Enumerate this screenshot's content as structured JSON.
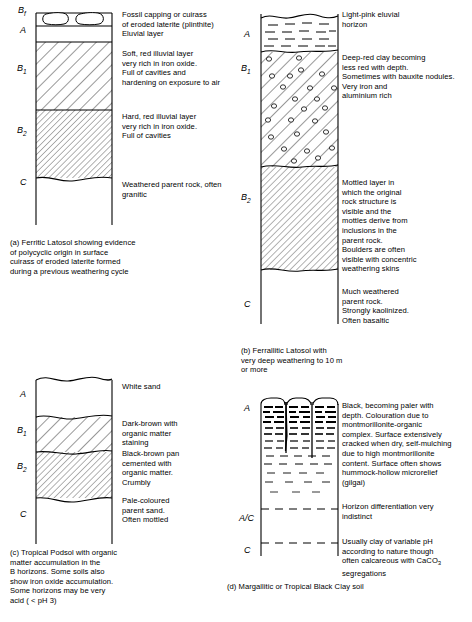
{
  "figure": {
    "panels": [
      {
        "id": "a",
        "caption": "(a) Ferritic Latosol showing evidence\nof polycyclic origin in surface\ncuirass of eroded laterite formed\nduring a previous weathering cycle",
        "horizons": [
          {
            "label": "B",
            "sub": "f",
            "fill": "plinthite-blobs"
          },
          {
            "label": "A",
            "sub": "",
            "fill": "blank"
          },
          {
            "label": "B",
            "sub": "1",
            "fill": "hatch-wide"
          },
          {
            "label": "B",
            "sub": "2",
            "fill": "hatch-fine"
          },
          {
            "label": "C",
            "sub": "",
            "fill": "blank"
          }
        ],
        "annotations": [
          "Fossil capping or cuirass\nof eroded laterite (plinthite)\nEluvial layer",
          "Soft, red illuvial layer\nvery rich in iron oxide.\nFull of cavities and\nhardening on exposure to air",
          "Hard, red illuvial layer\nvery rich in iron oxide.\nFull of cavities",
          "Weathered parent rock, often\ngranitic"
        ]
      },
      {
        "id": "b",
        "caption": "(b) Ferrallitic Latosol with\nvery deep weathering to 10 m\nor more",
        "horizons": [
          {
            "label": "A",
            "sub": "",
            "fill": "dashes"
          },
          {
            "label": "B",
            "sub": "1",
            "fill": "hatch-nodules"
          },
          {
            "label": "B",
            "sub": "2",
            "fill": "hatch-fine"
          },
          {
            "label": "C",
            "sub": "",
            "fill": "blank"
          }
        ],
        "annotations": [
          "Light-pink eluvial\nhorizon",
          "Deep-red clay becoming\nless red with depth.\nSometimes with bauxite nodules.\nVery iron and\naluminium rich",
          "Mottled layer in\nwhich the original\nrock structure is\nvisible and the\nmottles derive from\ninclusions in the\nparent rock.\nBoulders are often\nvisible with concentric\nweathering skins",
          "Much weathered\nparent rock.\nStrongly kaolinized.\nOften basaltic"
        ]
      },
      {
        "id": "c",
        "caption": "(c) Tropical Podsol with organic\nmatter accumulation in the\nB horizons. Some soils also\nshow iron oxide accumulation.\nSome horizons may be very\nacid ( < pH 3)",
        "horizons": [
          {
            "label": "A",
            "sub": "",
            "fill": "blank"
          },
          {
            "label": "B",
            "sub": "1",
            "fill": "hatch-wide"
          },
          {
            "label": "B",
            "sub": "2",
            "fill": "hatch-fine"
          },
          {
            "label": "C",
            "sub": "",
            "fill": "blank"
          }
        ],
        "annotations": [
          "White sand",
          "Dark-brown with\norganic matter\nstaining",
          "Black-brown pan\ncemented with\norganic matter.\nCrumbly",
          "Pale-coloured\nparent sand.\nOften mottled"
        ]
      },
      {
        "id": "d",
        "caption": "(d) Margallitic or Tropical Black Clay soil",
        "horizons": [
          {
            "label": "A",
            "sub": "",
            "fill": "dashes-graded-cracks"
          },
          {
            "label": "A/C",
            "sub": "",
            "fill": "blank"
          },
          {
            "label": "C",
            "sub": "",
            "fill": "blank"
          }
        ],
        "annotations": [
          "Black, becoming paler with\ndepth. Colouration due to\nmontmorillonite-organic\ncomplex. Surface extensively\ncracked when dry, self-mulching\ndue to high montmorillonite\ncontent. Surface often shows\nhummock-hollow microrelief\n(gilgai)",
          "Horizon differentiation very\nindistinct",
          "Usually clay of variable pH\naccording to nature though\noften calcareous with CaCO3\nsegregations"
        ],
        "annotation_3_parts": {
          "line1": "Usually clay of variable pH",
          "line2": "according to nature though",
          "line3a": "often calcareous with CaCO",
          "line3sub": "3",
          "line4": "segregations"
        }
      }
    ]
  },
  "style": {
    "line_color": "#000000",
    "background": "#ffffff"
  }
}
